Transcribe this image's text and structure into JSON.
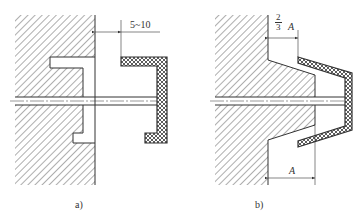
{
  "figure": {
    "subfigure_a": {
      "caption": "a)",
      "dimension_label": "5~10"
    },
    "subfigure_b": {
      "caption": "b)",
      "top_dimension": {
        "numerator": "2",
        "denominator": "3",
        "variable": "A"
      },
      "bottom_dimension_label": "A"
    }
  },
  "colors": {
    "line": "#333333",
    "background": "#ffffff"
  }
}
